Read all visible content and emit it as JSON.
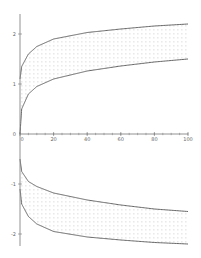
{
  "chart_data": {
    "type": "area",
    "title": "",
    "xlabel": "",
    "ylabel": "",
    "xlim": [
      0,
      100
    ],
    "ylim": [
      -2.3,
      2.4
    ],
    "grid": false,
    "legend": null,
    "x_ticks": [
      0,
      20,
      40,
      60,
      80,
      100
    ],
    "x_tick_labels": [
      "0",
      "20",
      "40",
      "60",
      "80",
      "100"
    ],
    "y_ticks": [
      2,
      1,
      0,
      -1,
      -2
    ],
    "y_tick_labels": [
      "2",
      "1",
      "0",
      "-1",
      "-2"
    ],
    "fill": "dotted",
    "series": [
      {
        "name": "upper-outer",
        "x": [
          0,
          1,
          5,
          10,
          20,
          40,
          60,
          80,
          100
        ],
        "values": [
          1.1,
          1.35,
          1.6,
          1.75,
          1.9,
          2.03,
          2.1,
          2.16,
          2.2
        ]
      },
      {
        "name": "upper-inner",
        "x": [
          0,
          1,
          5,
          10,
          20,
          40,
          60,
          80,
          100
        ],
        "values": [
          0.0,
          0.5,
          0.8,
          0.95,
          1.1,
          1.26,
          1.36,
          1.44,
          1.5
        ]
      },
      {
        "name": "lower-inner",
        "x": [
          0,
          1,
          5,
          10,
          20,
          40,
          60,
          80,
          100
        ],
        "values": [
          -0.5,
          -0.75,
          -0.95,
          -1.05,
          -1.18,
          -1.32,
          -1.42,
          -1.5,
          -1.55
        ]
      },
      {
        "name": "lower-outer",
        "x": [
          0,
          1,
          5,
          10,
          20,
          40,
          60,
          80,
          100
        ],
        "values": [
          -1.1,
          -1.4,
          -1.65,
          -1.8,
          -1.95,
          -2.06,
          -2.12,
          -2.17,
          -2.2
        ]
      }
    ],
    "regions": [
      {
        "between": [
          "upper-inner",
          "upper-outer"
        ],
        "pattern": "dots"
      },
      {
        "between": [
          "lower-outer",
          "lower-inner"
        ],
        "pattern": "dots"
      }
    ]
  },
  "colors": {
    "curve": "#555555",
    "axis": "#777777",
    "dots": "#aaaaaa",
    "background": "#ffffff"
  }
}
